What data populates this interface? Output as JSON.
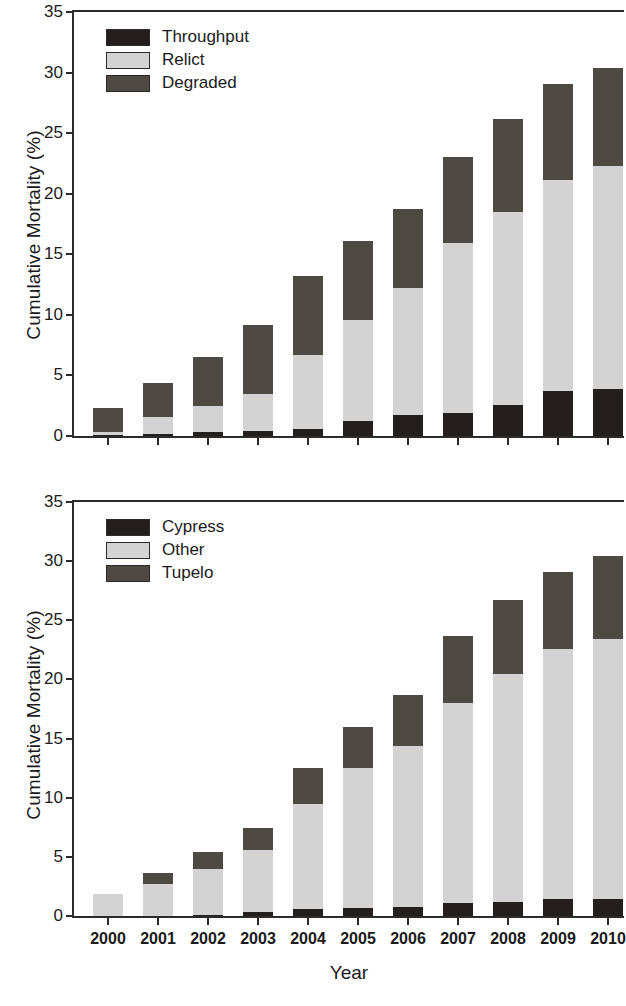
{
  "figure": {
    "xlabel": "Year",
    "ylabel": "Cumulative Mortality (%)"
  },
  "colors": {
    "dark": "#241f1c",
    "light": "#d3d3d3",
    "mid": "#4f4943",
    "axis": "#2b2b2b"
  },
  "panels": [
    {
      "id": "top",
      "legend": [
        {
          "label": "Throughput",
          "color": "#241f1c",
          "swatch": "dark"
        },
        {
          "label": "Relict",
          "color": "#d3d3d3",
          "swatch": "light"
        },
        {
          "label": "Degraded",
          "color": "#4f4943",
          "swatch": "mid"
        }
      ]
    },
    {
      "id": "bottom",
      "legend": [
        {
          "label": "Cypress",
          "color": "#241f1c",
          "swatch": "dark"
        },
        {
          "label": "Other",
          "color": "#d3d3d3",
          "swatch": "light"
        },
        {
          "label": "Tupelo",
          "color": "#4f4943",
          "swatch": "mid"
        }
      ]
    }
  ],
  "chart_data": [
    {
      "type": "bar",
      "subtype": "stacked",
      "panel": "top",
      "title": "",
      "xlabel": "Year",
      "ylabel": "Cumulative Mortality (%)",
      "ylim": [
        0,
        35
      ],
      "yticks": [
        0,
        5,
        10,
        15,
        20,
        25,
        30,
        35
      ],
      "grid": false,
      "legend_position": "top-left",
      "categories": [
        "2000",
        "2001",
        "2002",
        "2003",
        "2004",
        "2005",
        "2006",
        "2007",
        "2008",
        "2009",
        "2010"
      ],
      "series": [
        {
          "name": "Throughput",
          "color": "#241f1c",
          "values": [
            0.1,
            0.2,
            0.3,
            0.4,
            0.6,
            1.2,
            1.7,
            1.9,
            2.6,
            3.7,
            3.9
          ]
        },
        {
          "name": "Relict",
          "color": "#d3d3d3",
          "values": [
            0.2,
            1.4,
            2.2,
            3.1,
            6.1,
            8.4,
            10.5,
            14.0,
            15.9,
            17.4,
            18.4
          ]
        },
        {
          "name": "Degraded",
          "color": "#4f4943",
          "values": [
            2.0,
            2.8,
            4.0,
            5.7,
            6.5,
            6.5,
            6.5,
            7.1,
            7.7,
            8.0,
            8.1
          ]
        }
      ],
      "totals": [
        2.3,
        4.4,
        6.5,
        9.2,
        13.2,
        16.1,
        18.7,
        23.0,
        26.2,
        29.1,
        30.4
      ]
    },
    {
      "type": "bar",
      "subtype": "stacked",
      "panel": "bottom",
      "title": "",
      "xlabel": "Year",
      "ylabel": "Cumulative Mortality (%)",
      "ylim": [
        0,
        35
      ],
      "yticks": [
        0,
        5,
        10,
        15,
        20,
        25,
        30,
        35
      ],
      "grid": false,
      "legend_position": "top-left",
      "categories": [
        "2000",
        "2001",
        "2002",
        "2003",
        "2004",
        "2005",
        "2006",
        "2007",
        "2008",
        "2009",
        "2010"
      ],
      "series": [
        {
          "name": "Cypress",
          "color": "#241f1c",
          "values": [
            0.0,
            0.0,
            0.1,
            0.3,
            0.6,
            0.7,
            0.8,
            1.1,
            1.2,
            1.4,
            1.4
          ]
        },
        {
          "name": "Other",
          "color": "#d3d3d3",
          "values": [
            1.9,
            2.7,
            3.9,
            5.3,
            8.9,
            11.8,
            13.6,
            16.9,
            19.3,
            21.2,
            22.0
          ]
        },
        {
          "name": "Tupelo",
          "color": "#4f4943",
          "values": [
            0.0,
            0.9,
            1.4,
            1.8,
            3.0,
            3.5,
            4.3,
            5.7,
            6.2,
            6.5,
            7.0
          ]
        }
      ],
      "totals": [
        1.9,
        3.6,
        5.4,
        7.4,
        12.5,
        16.0,
        18.7,
        23.7,
        26.7,
        29.1,
        30.4
      ]
    }
  ]
}
